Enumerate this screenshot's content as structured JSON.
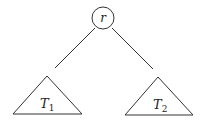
{
  "diagram": {
    "type": "binary-tree-schematic",
    "root": {
      "label": "r",
      "cx": 103,
      "cy": 18,
      "r": 11
    },
    "edges": [
      {
        "from": "r",
        "to": "T1",
        "x1": 95,
        "y1": 28,
        "x2": 55,
        "y2": 68
      },
      {
        "from": "r",
        "to": "T2",
        "x1": 112,
        "y1": 28,
        "x2": 153,
        "y2": 69
      }
    ],
    "subtrees": [
      {
        "id": "T1",
        "label_main": "T",
        "label_sub": "1",
        "apex": [
          47,
          76
        ],
        "base_left": [
          13,
          114
        ],
        "base_right": [
          82,
          114
        ],
        "text_x": 40,
        "text_y": 108
      },
      {
        "id": "T2",
        "label_main": "T",
        "label_sub": "2",
        "apex": [
          158,
          77
        ],
        "base_left": [
          125,
          115
        ],
        "base_right": [
          193,
          115
        ],
        "text_x": 153,
        "text_y": 109
      }
    ]
  }
}
